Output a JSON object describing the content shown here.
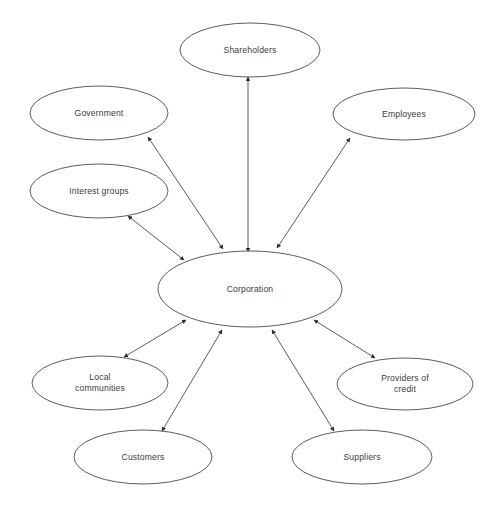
{
  "diagram": {
    "canvas": {
      "width": 498,
      "height": 511,
      "background": "#ffffff"
    },
    "style": {
      "node_stroke": "#4a4a4a",
      "node_fill": "#ffffff",
      "edge_stroke": "#4b4b4b",
      "text_color": "#3b3b3b",
      "arrowhead": "double-headed"
    },
    "nodes": [
      {
        "id": "corporation",
        "label": "Corporation",
        "cx": 250,
        "cy": 289,
        "rx": 92,
        "ry": 38
      },
      {
        "id": "shareholders",
        "label": "Shareholders",
        "cx": 250,
        "cy": 50,
        "rx": 70,
        "ry": 27
      },
      {
        "id": "government",
        "label": "Government",
        "cx": 99,
        "cy": 113,
        "rx": 69,
        "ry": 27
      },
      {
        "id": "employees",
        "label": "Employees",
        "cx": 404,
        "cy": 114,
        "rx": 71,
        "ry": 26
      },
      {
        "id": "interest-groups",
        "label": "Interest groups",
        "cx": 99,
        "cy": 191,
        "rx": 69,
        "ry": 27
      },
      {
        "id": "local-communities",
        "label": "Local\ncommunities",
        "cx": 100,
        "cy": 383,
        "rx": 68,
        "ry": 27
      },
      {
        "id": "providers-credit",
        "label": "Providers of\ncredit",
        "cx": 405,
        "cy": 384,
        "rx": 68,
        "ry": 26
      },
      {
        "id": "customers",
        "label": "Customers",
        "cx": 143,
        "cy": 457,
        "rx": 69,
        "ry": 27
      },
      {
        "id": "suppliers",
        "label": "Suppliers",
        "cx": 362,
        "cy": 457,
        "rx": 70,
        "ry": 27
      }
    ],
    "edges": [
      {
        "id": "edge-shareholders",
        "from": "corporation",
        "to": "shareholders",
        "x1": 248,
        "y1": 252,
        "x2": 248,
        "y2": 77,
        "bidirectional": true
      },
      {
        "id": "edge-government",
        "from": "corporation",
        "to": "government",
        "x1": 223,
        "y1": 249,
        "x2": 148,
        "y2": 137,
        "bidirectional": true
      },
      {
        "id": "edge-employees",
        "from": "corporation",
        "to": "employees",
        "x1": 277,
        "y1": 248,
        "x2": 350,
        "y2": 138,
        "bidirectional": true
      },
      {
        "id": "edge-interest-groups",
        "from": "corporation",
        "to": "interest-groups",
        "x1": 184,
        "y1": 260,
        "x2": 128,
        "y2": 216,
        "bidirectional": true
      },
      {
        "id": "edge-local-communities",
        "from": "corporation",
        "to": "local-communities",
        "x1": 186,
        "y1": 320,
        "x2": 124,
        "y2": 357,
        "bidirectional": true
      },
      {
        "id": "edge-customers",
        "from": "corporation",
        "to": "customers",
        "x1": 222,
        "y1": 330,
        "x2": 162,
        "y2": 431,
        "bidirectional": true
      },
      {
        "id": "edge-suppliers",
        "from": "corporation",
        "to": "suppliers",
        "x1": 272,
        "y1": 330,
        "x2": 334,
        "y2": 431,
        "bidirectional": true
      },
      {
        "id": "edge-providers-credit",
        "from": "corporation",
        "to": "providers-credit",
        "x1": 314,
        "y1": 320,
        "x2": 375,
        "y2": 358,
        "bidirectional": true
      }
    ]
  }
}
